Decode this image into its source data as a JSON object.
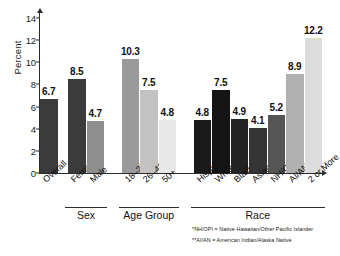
{
  "chart_data": {
    "type": "bar",
    "title": "",
    "xlabel": "",
    "ylabel": "Percent",
    "ylim": [
      0,
      14
    ],
    "yticks": [
      0,
      2,
      4,
      6,
      8,
      10,
      12,
      14
    ],
    "grid": false,
    "legend": "none",
    "categories": [
      "Overall",
      "Female",
      "Male",
      "18–25",
      "26–49",
      "50+",
      "Hispanic",
      "White",
      "Black",
      "Asian",
      "NH/OPI*",
      "AI/AN**",
      "2 or More"
    ],
    "values": [
      6.7,
      8.5,
      4.7,
      10.3,
      7.5,
      4.8,
      4.8,
      7.5,
      4.9,
      4.1,
      5.2,
      8.9,
      12.2
    ],
    "bar_colors": [
      "#3b3b3b",
      "#3b3b3b",
      "#8e8e8e",
      "#9a9a9a",
      "#c3c3c3",
      "#e8e8e8",
      "#1a1a1a",
      "#141414",
      "#232323",
      "#353535",
      "#555555",
      "#b0b0b0",
      "#dcdcdc"
    ],
    "groups": [
      {
        "label": "Sex",
        "start": 1,
        "end": 2
      },
      {
        "label": "Age Group",
        "start": 3,
        "end": 5
      },
      {
        "label": "Race",
        "start": 6,
        "end": 12
      }
    ],
    "annotations": [
      "*NH/OPI = Native Hawaiian/Other Pacific Islander",
      "**AI/AN = American Indian/Alaska Native"
    ]
  },
  "footnotes": {
    "nhopi": "*NH/OPI = Native Hawaiian/Other Pacific Islander",
    "aian": "**AI/AN = American Indian/Alaska Native"
  },
  "axis": {
    "y_title": "Percent",
    "ticks": [
      "0",
      "2",
      "4",
      "6",
      "8",
      "10",
      "12",
      "14"
    ]
  },
  "groups": {
    "sex": "Sex",
    "age": "Age Group",
    "race": "Race"
  },
  "corner": {
    "mark": ""
  }
}
